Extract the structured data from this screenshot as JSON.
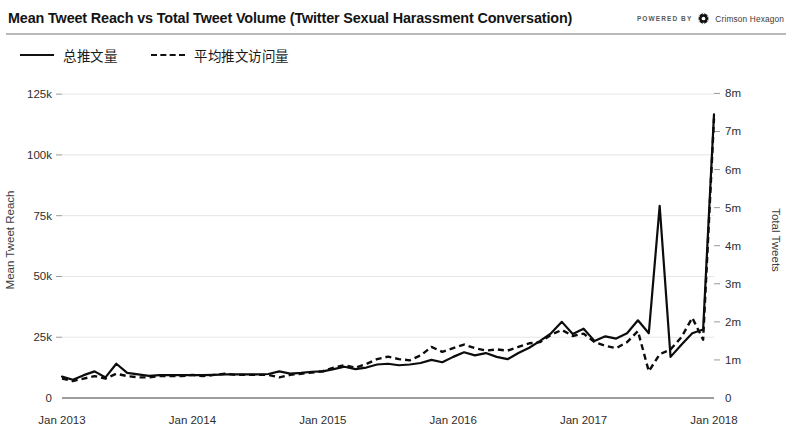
{
  "header": {
    "title": "Mean Tweet Reach vs Total Tweet Volume (Twitter Sexual Harassment Conversation)",
    "powered_by": "POWERED BY",
    "brand": "Crimson Hexagon",
    "brand_icon": "hexagon-icon"
  },
  "legend": {
    "position": "top-left",
    "items": [
      {
        "label": "总推文量",
        "style": "solid",
        "icon": "line-solid-icon"
      },
      {
        "label": "平均推文访问量",
        "style": "dashed",
        "icon": "line-dashed-icon"
      }
    ]
  },
  "chart_data": {
    "type": "line",
    "title": "Mean Tweet Reach vs Total Tweet Volume (Twitter Sexual Harassment Conversation)",
    "xlabel": "",
    "ylabel": "Mean Tweet Reach",
    "y2label": "Total Tweets",
    "grid": true,
    "legend_position": "top-left",
    "xlim": [
      "Jan 2013",
      "Jan 2018"
    ],
    "xticks": [
      "Jan 2013",
      "Jan 2014",
      "Jan 2015",
      "Jan 2016",
      "Jan 2017",
      "Jan 2018"
    ],
    "ylim": [
      0,
      130000
    ],
    "yticks": [
      0,
      25000,
      50000,
      75000,
      100000,
      125000
    ],
    "ytick_labels": [
      "0",
      "25k",
      "50k",
      "75k",
      "100k",
      "125k"
    ],
    "y2lim": [
      0,
      8300000
    ],
    "y2ticks": [
      0,
      1000000,
      2000000,
      3000000,
      4000000,
      5000000,
      6000000,
      7000000,
      8000000
    ],
    "y2tick_labels": [
      "0",
      "1m",
      "2m",
      "3m",
      "4m",
      "5m",
      "6m",
      "7m",
      "8m"
    ],
    "x": [
      "Jan 2013",
      "Feb 2013",
      "Mar 2013",
      "Apr 2013",
      "May 2013",
      "Jun 2013",
      "Jul 2013",
      "Aug 2013",
      "Sep 2013",
      "Oct 2013",
      "Nov 2013",
      "Dec 2013",
      "Jan 2014",
      "Feb 2014",
      "Mar 2014",
      "Apr 2014",
      "May 2014",
      "Jun 2014",
      "Jul 2014",
      "Aug 2014",
      "Sep 2014",
      "Oct 2014",
      "Nov 2014",
      "Dec 2014",
      "Jan 2015",
      "Feb 2015",
      "Mar 2015",
      "Apr 2015",
      "May 2015",
      "Jun 2015",
      "Jul 2015",
      "Aug 2015",
      "Sep 2015",
      "Oct 2015",
      "Nov 2015",
      "Dec 2015",
      "Jan 2016",
      "Feb 2016",
      "Mar 2016",
      "Apr 2016",
      "May 2016",
      "Jun 2016",
      "Jul 2016",
      "Aug 2016",
      "Sep 2016",
      "Oct 2016",
      "Nov 2016",
      "Dec 2016",
      "Jan 2017",
      "Feb 2017",
      "Mar 2017",
      "Apr 2017",
      "May 2017",
      "Jun 2017",
      "Jul 2017",
      "Aug 2017",
      "Sep 2017",
      "Oct 2017",
      "Nov 2017",
      "Dec 2017",
      "Jan 2018"
    ],
    "series": [
      {
        "name": "总推文量",
        "axis": "right",
        "units": "Total Tweets",
        "style": "solid",
        "values": [
          560000,
          480000,
          600000,
          700000,
          540000,
          900000,
          660000,
          620000,
          580000,
          600000,
          600000,
          600000,
          600000,
          600000,
          610000,
          620000,
          620000,
          620000,
          620000,
          630000,
          700000,
          640000,
          660000,
          690000,
          700000,
          760000,
          820000,
          760000,
          800000,
          880000,
          900000,
          860000,
          880000,
          920000,
          1000000,
          940000,
          1080000,
          1200000,
          1120000,
          1180000,
          1080000,
          1020000,
          1180000,
          1320000,
          1500000,
          1700000,
          2000000,
          1680000,
          1820000,
          1500000,
          1620000,
          1560000,
          1700000,
          2040000,
          1700000,
          5050000,
          1080000,
          1400000,
          1700000,
          1800000,
          7450000
        ]
      },
      {
        "name": "平均推文访问量",
        "axis": "left",
        "units": "Mean Tweet Reach",
        "style": "dashed",
        "values": [
          8000,
          7000,
          8000,
          9000,
          8000,
          10000,
          9000,
          8500,
          8500,
          9000,
          9000,
          9000,
          9500,
          9000,
          9500,
          10000,
          9500,
          9500,
          9500,
          9500,
          8500,
          9500,
          10000,
          10500,
          11000,
          12500,
          13500,
          12500,
          14000,
          16000,
          17000,
          16000,
          15500,
          17500,
          21000,
          19000,
          20500,
          22000,
          20500,
          19500,
          20000,
          19500,
          21000,
          22500,
          23000,
          26000,
          28000,
          25500,
          26500,
          23000,
          21500,
          20500,
          23000,
          27500,
          11000,
          18000,
          20000,
          25000,
          33000,
          24000,
          115000
        ]
      }
    ],
    "annotations": [
      {
        "label": "peak-solid",
        "x": "Aug 2017",
        "value": 5050000
      },
      {
        "label": "peak-final-solid",
        "x": "Jan 2018",
        "value": 7450000
      },
      {
        "label": "peak-final-dashed",
        "x": "Jan 2018",
        "value": 115000
      }
    ]
  }
}
